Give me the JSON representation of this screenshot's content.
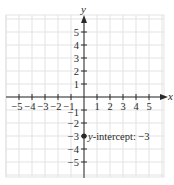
{
  "chart_data": {
    "type": "scatter",
    "title": "",
    "xlabel": "x",
    "ylabel": "y",
    "xlim": [
      -6,
      6
    ],
    "ylim": [
      -6,
      6
    ],
    "grid": true,
    "x_ticks": [
      -5,
      -4,
      -3,
      -2,
      -1,
      1,
      2,
      3,
      4,
      5
    ],
    "y_ticks": [
      -5,
      -4,
      -3,
      -2,
      -1,
      1,
      2,
      3,
      4,
      5
    ],
    "x_tick_labels": [
      "−5",
      "−4",
      "−3",
      "−2",
      "−1",
      "1",
      "2",
      "3",
      "4",
      "5"
    ],
    "y_tick_labels": [
      "−5",
      "−4",
      "−3",
      "−2",
      "−1",
      "1",
      "2",
      "3",
      "4",
      "5"
    ],
    "series": [
      {
        "name": "y-intercept",
        "points": [
          {
            "x": 0,
            "y": -3
          }
        ]
      }
    ],
    "annotations": [
      {
        "text": "y-intercept: −3",
        "italic_prefix": "y",
        "rest": "-intercept: −3",
        "x": 0,
        "y": -3
      }
    ],
    "colors": {
      "grid": "#e3e3e3",
      "axis": "#2a2a2a",
      "point": "#2a2a2a"
    }
  }
}
